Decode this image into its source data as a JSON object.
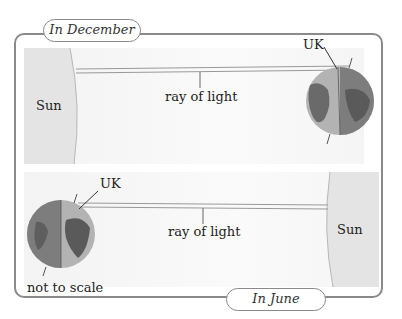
{
  "tabs": {
    "december": "In December",
    "june": "In June"
  },
  "december_panel": {
    "sun_label": "Sun",
    "ray_label": "ray of light",
    "uk_label": "UK"
  },
  "june_panel": {
    "sun_label": "Sun",
    "ray_label": "ray of light",
    "uk_label": "UK"
  },
  "note": "not to scale",
  "colors": {
    "frame": "#8a8a8a",
    "sun": "#e2e2e2",
    "earth_dark": "#7a7a7a",
    "earth_light": "#b5b5b5",
    "land": "#5e5e5e"
  }
}
